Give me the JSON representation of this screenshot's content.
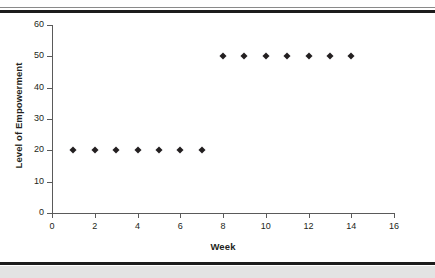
{
  "chart_data": {
    "type": "scatter",
    "title": "",
    "xlabel": "Week",
    "ylabel": "Level of Empowerment",
    "xlim": [
      0,
      16
    ],
    "ylim": [
      0,
      60
    ],
    "xticks": [
      0,
      2,
      4,
      6,
      8,
      10,
      12,
      14,
      16
    ],
    "yticks": [
      0,
      10,
      20,
      30,
      40,
      50,
      60
    ],
    "grid": false,
    "legend": null,
    "marker": "diamond",
    "marker_color": "#231f20",
    "x": [
      1,
      2,
      3,
      4,
      5,
      6,
      7,
      8,
      9,
      10,
      11,
      12,
      13,
      14
    ],
    "values": [
      20,
      20,
      20,
      20,
      20,
      20,
      20,
      50,
      50,
      50,
      50,
      50,
      50,
      50
    ],
    "series": [
      {
        "name": "Level of Empowerment",
        "points": [
          {
            "x": 1,
            "y": 20
          },
          {
            "x": 2,
            "y": 20
          },
          {
            "x": 3,
            "y": 20
          },
          {
            "x": 4,
            "y": 20
          },
          {
            "x": 5,
            "y": 20
          },
          {
            "x": 6,
            "y": 20
          },
          {
            "x": 7,
            "y": 20
          },
          {
            "x": 8,
            "y": 50
          },
          {
            "x": 9,
            "y": 50
          },
          {
            "x": 10,
            "y": 50
          },
          {
            "x": 11,
            "y": 50
          },
          {
            "x": 12,
            "y": 50
          },
          {
            "x": 13,
            "y": 50
          },
          {
            "x": 14,
            "y": 50
          }
        ]
      }
    ]
  },
  "axes": {
    "y_title": "Level of Empowerment",
    "x_title": "Week",
    "y_tick_labels": [
      "0",
      "10",
      "20",
      "30",
      "40",
      "50",
      "60"
    ],
    "x_tick_labels": [
      "0",
      "2",
      "4",
      "6",
      "8",
      "10",
      "12",
      "14",
      "16"
    ]
  },
  "colors": {
    "axis": "#5a5a5a",
    "text": "#231f20",
    "rule": "#1c1c1c",
    "band": "#e3e3e3"
  }
}
